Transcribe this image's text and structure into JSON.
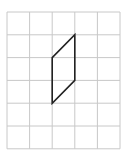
{
  "diagram": {
    "type": "grid-with-shape",
    "grid": {
      "columns": 5,
      "rows": 6,
      "origin_px": [
        7,
        12
      ],
      "cell_width_px": 22.6,
      "cell_height_px": 22.8,
      "line_color": "#c8c8c8"
    },
    "shape": {
      "name": "parallelogram",
      "stroke_color": "#222222",
      "vertices_grid": [
        [
          2,
          2
        ],
        [
          3,
          1
        ],
        [
          3,
          3
        ],
        [
          2,
          4
        ]
      ]
    }
  }
}
